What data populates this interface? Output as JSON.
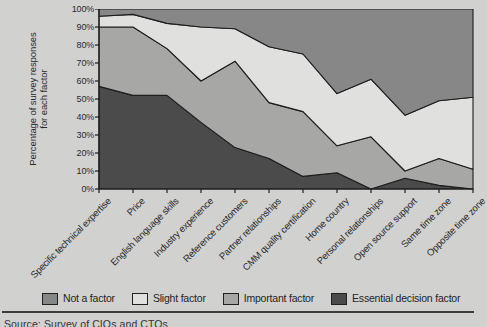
{
  "page": {
    "background": "#d1d1d0"
  },
  "colors": {
    "essential": "#4b4b4b",
    "important": "#a7a7a5",
    "slight": "#e0e0de",
    "not_a_factor": "#878787",
    "outline": "#1d1d1d",
    "axis": "#1d1d1d",
    "text": "#2b2b2b"
  },
  "y_axis": {
    "title_line1": "Percentage of survey responses",
    "title_line2": "for each factor",
    "tick_labels": [
      "0%",
      "10%",
      "20%",
      "30%",
      "40%",
      "50%",
      "60%",
      "70%",
      "80%",
      "90%",
      "100%"
    ]
  },
  "chart_data": {
    "type": "area",
    "stacked": "percent",
    "title": "",
    "xlabel": "",
    "ylabel": "Percentage of survey responses for each factor",
    "ylim": [
      0,
      100
    ],
    "grid": false,
    "legend_position": "bottom",
    "categories": [
      "Specific technical expertise",
      "Price",
      "English language skills",
      "Industry experience",
      "Reference customers",
      "Partner relationships",
      "CMM quality certification",
      "Home country",
      "Personal relationships",
      "Open source support",
      "Same time zone",
      "Opposite time zone"
    ],
    "series": [
      {
        "name": "Essential decision factor",
        "color_key": "essential",
        "values": [
          57,
          52,
          52,
          37,
          23,
          17,
          7,
          9,
          0,
          6,
          2,
          0
        ]
      },
      {
        "name": "Important factor",
        "color_key": "important",
        "values": [
          33,
          38,
          26,
          23,
          48,
          31,
          36,
          15,
          29,
          4,
          15,
          11
        ]
      },
      {
        "name": "Slight factor",
        "color_key": "slight",
        "values": [
          6,
          7,
          14,
          30,
          18,
          31,
          32,
          29,
          32,
          31,
          32,
          40
        ]
      },
      {
        "name": "Not a factor",
        "color_key": "not_a_factor",
        "values": [
          4,
          3,
          8,
          10,
          11,
          21,
          25,
          47,
          39,
          59,
          51,
          49
        ]
      }
    ]
  },
  "legend": {
    "items": [
      {
        "label": "Not a factor",
        "color_key": "not_a_factor"
      },
      {
        "label": "Slight factor",
        "color_key": "slight"
      },
      {
        "label": "Important factor",
        "color_key": "important"
      },
      {
        "label": "Essential decision factor",
        "color_key": "essential"
      }
    ]
  },
  "footer": {
    "source_note": "Source: Survey of CIOs and CTOs"
  }
}
